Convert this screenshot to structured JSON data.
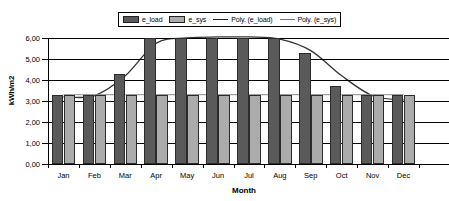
{
  "chart_data": {
    "type": "bar",
    "title": "",
    "xlabel": "Month",
    "ylabel": "kWh/m2",
    "categories": [
      "Jan",
      "Feb",
      "Mar",
      "Apr",
      "May",
      "Jun",
      "Jul",
      "Aug",
      "Sep",
      "Oct",
      "Nov",
      "Dec"
    ],
    "series": [
      {
        "name": "e_load",
        "values": [
          3.3,
          3.3,
          4.3,
          6.0,
          6.0,
          6.0,
          6.0,
          6.0,
          5.3,
          3.7,
          3.3,
          3.3
        ],
        "color": "#5a5a5a"
      },
      {
        "name": "e_sys",
        "values": [
          3.3,
          3.3,
          3.3,
          3.3,
          3.3,
          3.3,
          3.3,
          3.3,
          3.3,
          3.3,
          3.3,
          3.3
        ],
        "color": "#ababab"
      }
    ],
    "trendlines": [
      {
        "name": "Poly. (e_load)",
        "values": [
          3.2,
          3.25,
          4.2,
          5.75,
          6.0,
          6.05,
          6.05,
          5.95,
          5.4,
          4.2,
          3.25,
          3.05
        ],
        "color": "#333333"
      },
      {
        "name": "Poly. (e_sys)",
        "values": [
          3.3,
          3.3,
          3.3,
          3.3,
          3.3,
          3.3,
          3.3,
          3.3,
          3.3,
          3.3,
          3.3,
          3.3
        ],
        "color": "#888888"
      }
    ],
    "ylim": [
      0,
      6
    ],
    "yticks": [
      0,
      1,
      2,
      3,
      4,
      5,
      6
    ],
    "ytick_labels": [
      "0,00",
      "1,00",
      "2,00",
      "3,00",
      "4,00",
      "5,00",
      "6,00"
    ],
    "grid": true,
    "legend_position": "top"
  },
  "legend": {
    "items": [
      {
        "label": "e_load",
        "marker": "swatch-dark"
      },
      {
        "label": "e_sys",
        "marker": "swatch-light"
      },
      {
        "label": "Poly. (e_load)",
        "marker": "line-dark"
      },
      {
        "label": "Poly. (e_sys)",
        "marker": "line-light"
      }
    ]
  },
  "axes": {
    "x_title": "Month",
    "y_title": "kWh/m2"
  }
}
